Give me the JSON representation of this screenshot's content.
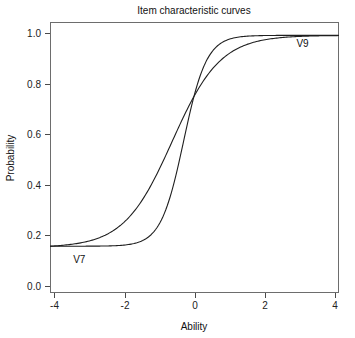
{
  "chart_data": {
    "type": "line",
    "title": "Item characteristic curves",
    "xlabel": "Ability",
    "ylabel": "Probability",
    "xlim": [
      -4,
      4
    ],
    "ylim": [
      0,
      1.05
    ],
    "grid": false,
    "legend_position": "inline-annotations",
    "xticks": [
      -4,
      -2,
      0,
      2,
      4
    ],
    "xtick_labels": [
      "-4",
      "-2",
      "0",
      "2",
      "4"
    ],
    "yticks": [
      0.0,
      0.2,
      0.4,
      0.6,
      0.8,
      1.0
    ],
    "ytick_labels": [
      "0.0",
      "0.2",
      "0.4",
      "0.6",
      "0.8",
      "1.0"
    ],
    "x": [
      -4,
      -3.75,
      -3.5,
      -3.25,
      -3,
      -2.75,
      -2.5,
      -2.25,
      -2,
      -1.75,
      -1.5,
      -1.25,
      -1,
      -0.75,
      -0.5,
      -0.25,
      0,
      0.25,
      0.5,
      0.75,
      1,
      1.25,
      1.5,
      1.75,
      2,
      2.25,
      2.5,
      2.75,
      3,
      3.25,
      3.5,
      3.75,
      4
    ],
    "series": [
      {
        "name": "V7",
        "label": "V7",
        "color": "#1f1f1f",
        "discrimination": 1.85,
        "difficulty": -0.3,
        "guessing": 0.18,
        "values": [
          0.181,
          0.182,
          0.183,
          0.184,
          0.186,
          0.189,
          0.192,
          0.197,
          0.204,
          0.214,
          0.228,
          0.248,
          0.276,
          0.316,
          0.37,
          0.438,
          0.519,
          0.605,
          0.69,
          0.765,
          0.826,
          0.873,
          0.907,
          0.932,
          0.95,
          0.963,
          0.972,
          0.979,
          0.984,
          0.988,
          0.991,
          0.993,
          0.995
        ]
      },
      {
        "name": "V9",
        "label": "V9",
        "color": "#1f1f1f",
        "discrimination": 0.88,
        "difficulty": -0.62,
        "guessing": 0.175,
        "values": [
          0.186,
          0.192,
          0.199,
          0.207,
          0.216,
          0.228,
          0.241,
          0.257,
          0.276,
          0.297,
          0.322,
          0.35,
          0.382,
          0.416,
          0.453,
          0.492,
          0.532,
          0.571,
          0.61,
          0.647,
          0.681,
          0.713,
          0.742,
          0.768,
          0.791,
          0.811,
          0.829,
          0.845,
          0.858,
          0.87,
          0.88,
          0.889,
          0.896
        ]
      }
    ],
    "annotations": [
      {
        "text": "V7",
        "x": -3.2,
        "y": 0.115
      },
      {
        "text": "V9",
        "x": 3.0,
        "y": 0.955
      }
    ],
    "crossing_point": {
      "x": -0.77,
      "y": 0.4
    }
  }
}
